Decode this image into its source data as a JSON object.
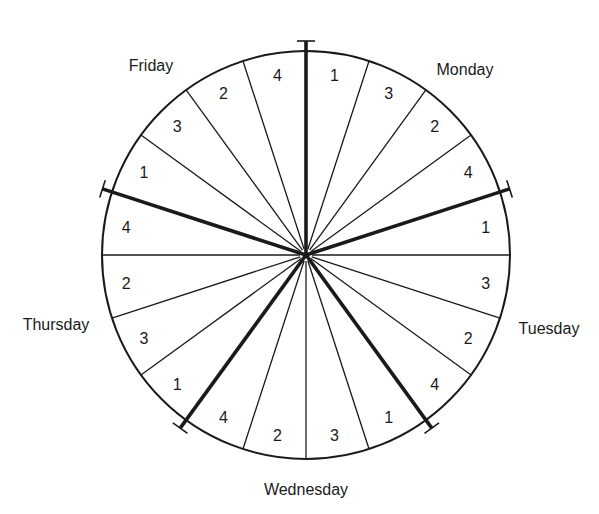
{
  "diagram": {
    "type": "schedule-wheel",
    "center": {
      "x": 306,
      "y": 255
    },
    "radius": 204,
    "colors": {
      "line": "#1a1a1a",
      "background": "#ffffff"
    },
    "days": [
      {
        "name": "Monday",
        "slots": [
          "1",
          "3",
          "2",
          "4"
        ],
        "label_pos": {
          "x": 465,
          "y": 75
        }
      },
      {
        "name": "Tuesday",
        "slots": [
          "1",
          "3",
          "2",
          "4"
        ],
        "label_pos": {
          "x": 549,
          "y": 334
        }
      },
      {
        "name": "Wednesday",
        "slots": [
          "1",
          "3",
          "2",
          "4"
        ],
        "label_pos": {
          "x": 306,
          "y": 495
        }
      },
      {
        "name": "Thursday",
        "slots": [
          "1",
          "3",
          "2",
          "4"
        ],
        "label_pos": {
          "x": 56,
          "y": 330
        }
      },
      {
        "name": "Friday",
        "slots": [
          "1",
          "3",
          "2",
          "4"
        ],
        "label_pos": {
          "x": 151,
          "y": 71
        }
      }
    ]
  }
}
